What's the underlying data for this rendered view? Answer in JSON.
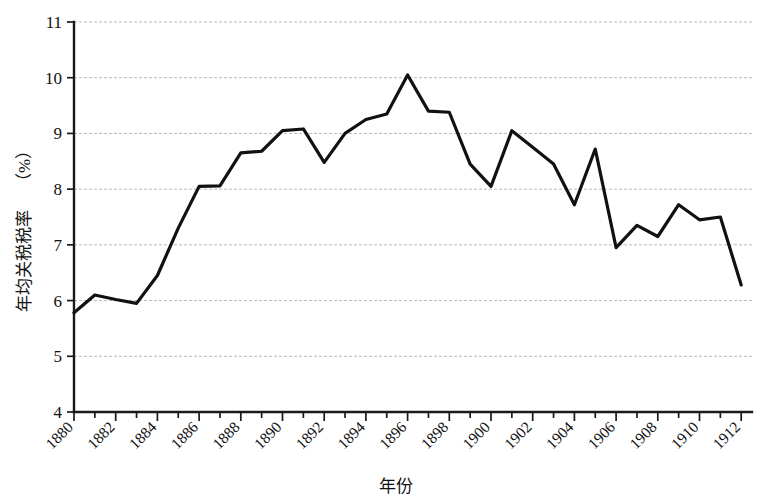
{
  "chart_data": {
    "type": "line",
    "title": "",
    "xlabel": "年份",
    "ylabel": "年均关税税率（%）",
    "ylabel_cjk": "年均关税税率",
    "ylabel_unit": "（%）",
    "xlim": [
      1879,
      1913
    ],
    "ylim": [
      4,
      11
    ],
    "grid": true,
    "legend": "none",
    "line_color": "#111111",
    "grid_color": "#b9b9b9",
    "axis_color": "#1a1a1a",
    "y_ticks": [
      4,
      5,
      6,
      7,
      8,
      9,
      10,
      11
    ],
    "y_tick_labels": [
      "4",
      "5",
      "6",
      "7",
      "8",
      "9",
      "10",
      "11"
    ],
    "x_ticks": [
      1880,
      1882,
      1884,
      1886,
      1888,
      1890,
      1892,
      1894,
      1896,
      1898,
      1900,
      1902,
      1904,
      1906,
      1908,
      1910,
      1912
    ],
    "x_tick_labels": [
      "1880",
      "1882",
      "1884",
      "1886",
      "1888",
      "1890",
      "1892",
      "1894",
      "1896",
      "1898",
      "1900",
      "1902",
      "1904",
      "1906",
      "1908",
      "1910",
      "1912"
    ],
    "x": [
      1880,
      1881,
      1882,
      1883,
      1884,
      1885,
      1886,
      1887,
      1888,
      1889,
      1890,
      1891,
      1892,
      1893,
      1894,
      1895,
      1896,
      1897,
      1898,
      1899,
      1900,
      1901,
      1902,
      1903,
      1904,
      1905,
      1906,
      1907,
      1908,
      1909,
      1910,
      1911,
      1912
    ],
    "values": [
      5.78,
      6.1,
      6.02,
      5.95,
      6.45,
      7.3,
      8.05,
      8.06,
      8.65,
      8.68,
      9.05,
      9.08,
      8.48,
      9.0,
      9.25,
      9.35,
      10.05,
      9.4,
      9.38,
      8.45,
      8.05,
      9.05,
      8.75,
      8.45,
      7.72,
      8.72,
      6.95,
      7.35,
      7.15,
      7.72,
      7.45,
      7.5,
      6.28
    ],
    "series": [
      {
        "name": "年均关税税率",
        "values": [
          5.78,
          6.1,
          6.02,
          5.95,
          6.45,
          7.3,
          8.05,
          8.06,
          8.65,
          8.68,
          9.05,
          9.08,
          8.48,
          9.0,
          9.25,
          9.35,
          10.05,
          9.4,
          9.38,
          8.45,
          8.05,
          9.05,
          8.75,
          8.45,
          7.72,
          8.72,
          6.95,
          7.35,
          7.15,
          7.72,
          7.45,
          7.5,
          6.28
        ]
      }
    ]
  }
}
